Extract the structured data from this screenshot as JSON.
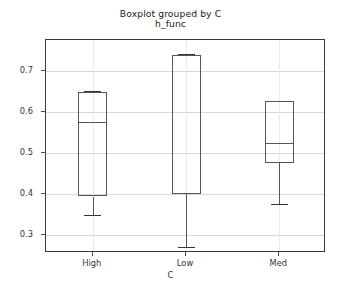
{
  "chart_data": {
    "type": "box",
    "title": "Boxplot grouped by C",
    "subtitle": "h_func",
    "xlabel": "C",
    "ylabel": "",
    "categories": [
      "High",
      "Low",
      "Med"
    ],
    "ylim": [
      0.255,
      0.775
    ],
    "yticks": [
      0.3,
      0.4,
      0.5,
      0.6,
      0.7
    ],
    "ytick_labels": [
      "0.3",
      "0.4",
      "0.5",
      "0.6",
      "0.7"
    ],
    "grid": true,
    "legend": "none",
    "boxes": [
      {
        "category": "High",
        "whisker_low": 0.347,
        "q1": 0.393,
        "median": 0.576,
        "q3": 0.649,
        "whisker_high": 0.649
      },
      {
        "category": "Low",
        "whisker_low": 0.268,
        "q1": 0.399,
        "median": 0.738,
        "q3": 0.738,
        "whisker_high": 0.738
      },
      {
        "category": "Med",
        "whisker_low": 0.373,
        "q1": 0.474,
        "median": 0.524,
        "q3": 0.625,
        "whisker_high": 0.625
      }
    ],
    "colors": {
      "box_edge": "#555555",
      "median": "#555555",
      "whisker": "#555555",
      "cap": "#333333",
      "grid": "#d9d9d9",
      "axis": "#3a3a3a",
      "background": "#ffffff",
      "text": "#333333"
    }
  }
}
